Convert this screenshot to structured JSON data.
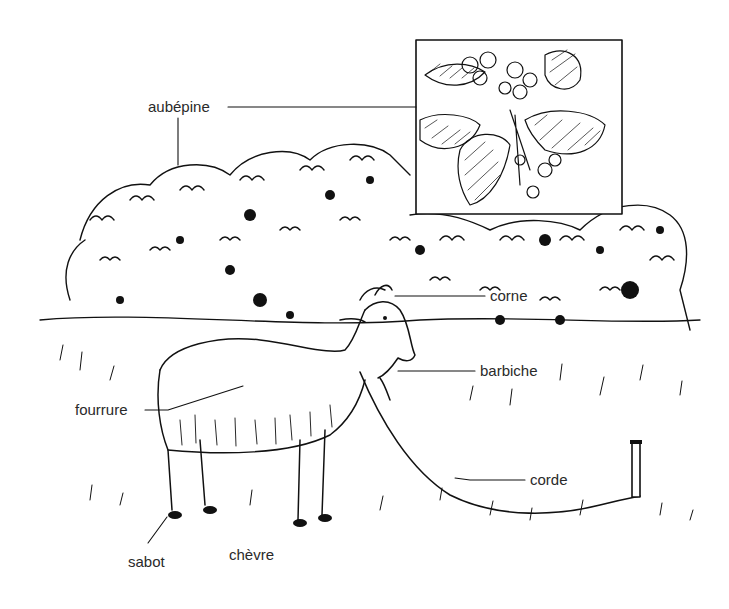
{
  "figure": {
    "title": "",
    "labels": {
      "aubepine": "aubépine",
      "corne": "corne",
      "barbiche": "barbiche",
      "fourrure": "fourrure",
      "corde": "corde",
      "sabot": "sabot",
      "chevre": "chèvre"
    },
    "inset": {
      "subject": "aubépine (rameau en fleurs)"
    },
    "colors": {
      "ink": "#111111",
      "label": "#2a2a2a",
      "background": "#ffffff"
    }
  }
}
